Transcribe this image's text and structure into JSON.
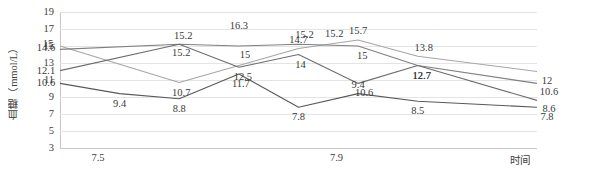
{
  "chart_data": {
    "type": "line",
    "title": "",
    "xlabel": "时间",
    "ylabel": "血糖（mmol/L）",
    "ylim": [
      3,
      19
    ],
    "ytick_labels": [
      "19",
      "17",
      "15",
      "13",
      "11",
      "9",
      "7",
      "5",
      "3"
    ],
    "ytick_values": [
      19,
      17,
      15,
      13,
      11,
      9,
      7,
      5,
      3
    ],
    "grid": true,
    "legend": "none",
    "x": [
      1,
      2,
      3,
      4,
      5,
      6,
      7,
      8,
      9
    ],
    "xtick_labels": [
      "7.5",
      "7.9"
    ],
    "xtick_positions": [
      1,
      5
    ],
    "series": [
      {
        "name": "series-1",
        "color": "#a6a6a6",
        "x": [
          1,
          3,
          5,
          6,
          7,
          9
        ],
        "values": [
          15,
          10.7,
          14.7,
          15.7,
          13.8,
          12
        ],
        "labels": [
          "15",
          "10.7",
          "14.7",
          "15.7",
          "13.8",
          "12"
        ]
      },
      {
        "name": "series-2",
        "color": "#808080",
        "x": [
          1,
          3,
          4,
          5,
          6,
          7,
          9
        ],
        "values": [
          14.6,
          15.2,
          15,
          15.2,
          15,
          12.7,
          10.6
        ],
        "labels": [
          "14.6",
          "15.2",
          "15",
          "15.2",
          "15",
          "12.7",
          "10.6"
        ]
      },
      {
        "name": "series-3",
        "color": "#6e6e6e",
        "x": [
          1,
          3,
          4,
          5,
          6,
          7,
          9
        ],
        "values": [
          12.1,
          15.2,
          12.5,
          14,
          10.6,
          12.7,
          8.6
        ],
        "labels": [
          "12.1",
          "15.2",
          "12.5",
          "14",
          "10.6",
          "12.7",
          "8.6"
        ]
      },
      {
        "name": "series-4",
        "color": "#595959",
        "x": [
          1,
          2,
          3,
          4,
          5,
          6,
          7,
          9
        ],
        "values": [
          10.6,
          9.4,
          8.8,
          11.7,
          7.8,
          9.4,
          8.5,
          7.8
        ],
        "labels": [
          "10.6",
          "9.4",
          "8.8",
          "11.7",
          "7.8",
          "9.4",
          "8.5",
          "7.8"
        ]
      }
    ],
    "extra_labels": [
      {
        "text": "16.3",
        "x": 4,
        "value": 16.3
      },
      {
        "text": "15.2",
        "x": 5.6,
        "value": 15.35
      }
    ]
  }
}
